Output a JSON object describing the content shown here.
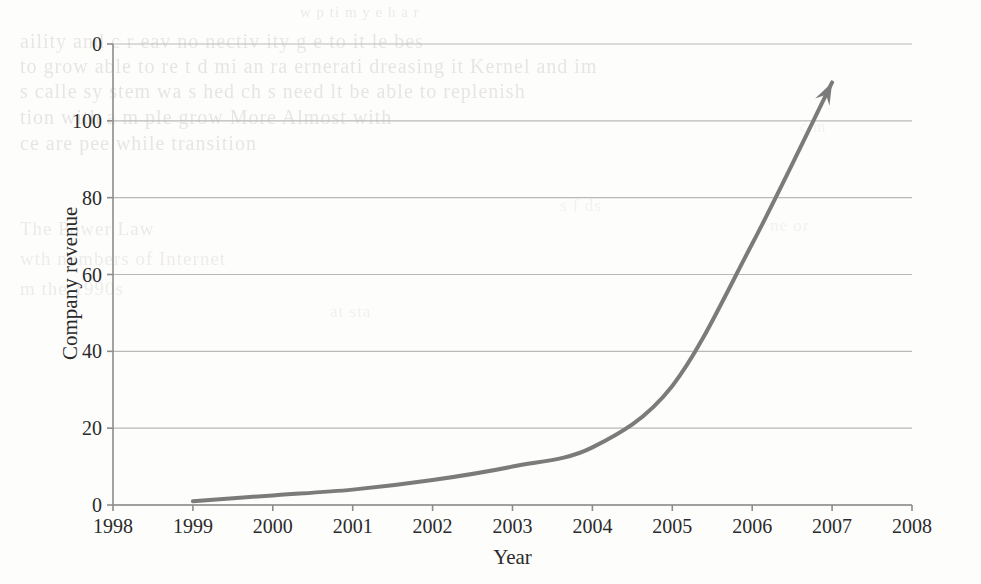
{
  "page": {
    "background_color": "#fdfdfc",
    "width": 981,
    "height": 584
  },
  "chart_data": {
    "type": "line",
    "title": "",
    "xlabel": "Year",
    "ylabel": "Company revenue",
    "x": [
      1999,
      2000,
      2001,
      2002,
      2003,
      2004,
      2005,
      2006,
      2007
    ],
    "series": [
      {
        "name": "Company revenue",
        "values": [
          1,
          2.5,
          4,
          6.5,
          10,
          15,
          31,
          68,
          110
        ]
      }
    ],
    "xlim": [
      1998,
      2008
    ],
    "ylim": [
      0,
      120
    ],
    "xticks": [
      1998,
      1999,
      2000,
      2001,
      2002,
      2003,
      2004,
      2005,
      2006,
      2007,
      2008
    ],
    "xtick_labels": [
      "1998",
      "1999",
      "2000",
      "2001",
      "2002",
      "2003",
      "2004",
      "2005",
      "2006",
      "2007",
      "2008"
    ],
    "yticks": [
      0,
      20,
      40,
      60,
      80,
      100,
      120
    ],
    "ytick_labels": [
      "0",
      "20",
      "40",
      "60",
      "80",
      "100",
      "0"
    ],
    "grid": "horizontal",
    "legend": "none",
    "line_color": "#7b7b7b",
    "grid_color": "#b9b9b9",
    "axis_color": "#8c8c8c",
    "text_color": "#2b2b2b",
    "line_width": 4,
    "arrow_head": true,
    "annotations": [
      {
        "name": "growth-arrowhead",
        "text": "",
        "at_x": 2007.0,
        "at_y": 112
      }
    ]
  },
  "bleed_through_text": {
    "note": "faint mirror-image show-through from the reverse side of the scanned book page",
    "lines": [
      {
        "text": "w  p  ti   m  y  e  h a   r",
        "x": 300,
        "y": 4,
        "size": 15,
        "opacity": 0.35
      },
      {
        "text": "aility and c  r eav  no   nectiv  ity  g  e  to  it   le  bes",
        "x": 20,
        "y": 30,
        "size": 20,
        "opacity": 0.4
      },
      {
        "text": "to  grow   able  to  re  t  d  mi  an  ra  ernerati  dreasing it  Kernel and  im",
        "x": 20,
        "y": 55,
        "size": 20,
        "opacity": 0.42
      },
      {
        "text": "s  calle   sy   stem   wa   s  hed  ch   s  need   lt  be able to replenish",
        "x": 20,
        "y": 80,
        "size": 20,
        "opacity": 0.42
      },
      {
        "text": "tion   with   a  m  ple   grow   More  Almost   with",
        "x": 20,
        "y": 106,
        "size": 20,
        "opacity": 0.42
      },
      {
        "text": "ce   are  pee  while  transition",
        "x": 20,
        "y": 132,
        "size": 20,
        "opacity": 0.42
      },
      {
        "text": "The   Power   Law",
        "x": 20,
        "y": 218,
        "size": 19,
        "opacity": 0.33
      },
      {
        "text": "wth   numbers   of   Internet",
        "x": 20,
        "y": 248,
        "size": 19,
        "opacity": 0.3
      },
      {
        "text": "m   the   1990s",
        "x": 20,
        "y": 278,
        "size": 19,
        "opacity": 0.3
      },
      {
        "text": "at   sta",
        "x": 330,
        "y": 302,
        "size": 17,
        "opacity": 0.22
      },
      {
        "text": "s  f  ds",
        "x": 560,
        "y": 196,
        "size": 17,
        "opacity": 0.2
      },
      {
        "text": "ne   or",
        "x": 770,
        "y": 216,
        "size": 17,
        "opacity": 0.2
      },
      {
        "text": "c  m",
        "x": 800,
        "y": 118,
        "size": 16,
        "opacity": 0.2
      }
    ]
  }
}
